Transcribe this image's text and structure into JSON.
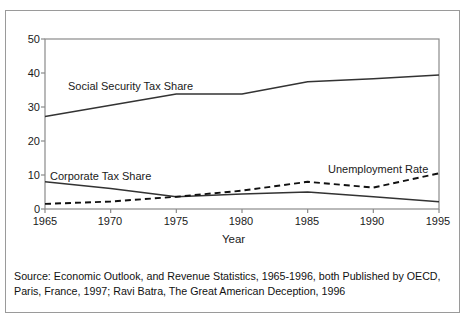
{
  "figure": {
    "top_caption": "",
    "source_note": "Source: Economic Outlook, and Revenue Statistics, 1965-1996, both Published by OECD, Paris, France, 1997; Ravi Batra, The Great American Deception, 1996"
  },
  "labels": {
    "social_security": "Social Security Tax Share",
    "corporate": "Corporate Tax Share",
    "unemployment": "Unemployment Rate"
  },
  "chart_data": {
    "type": "line",
    "title": "",
    "xlabel": "Year",
    "ylabel": "",
    "x": [
      1965,
      1970,
      1975,
      1980,
      1985,
      1990,
      1995
    ],
    "xlim": [
      1965,
      1995
    ],
    "ylim": [
      0,
      50
    ],
    "yticks": [
      0,
      10,
      20,
      30,
      40,
      50
    ],
    "xticks": [
      1965,
      1970,
      1975,
      1980,
      1985,
      1990,
      1995
    ],
    "xtick_labels": [
      "1965",
      "1970",
      "1975",
      "1980",
      "1985",
      "1990",
      "1995"
    ],
    "ytick_labels": [
      "0",
      "10",
      "20",
      "30",
      "40",
      "50"
    ],
    "grid": false,
    "legend": "inline-annotations",
    "series": [
      {
        "name": "Social Security Tax Share",
        "style": "solid",
        "color": "#333333",
        "values": [
          27.2,
          30.5,
          33.8,
          33.8,
          37.4,
          38.3,
          39.4
        ]
      },
      {
        "name": "Corporate Tax Share",
        "style": "solid",
        "color": "#333333",
        "values": [
          8.0,
          6.0,
          3.6,
          4.4,
          5.0,
          3.6,
          2.1
        ]
      },
      {
        "name": "Unemployment Rate",
        "style": "dashed",
        "color": "#111111",
        "values": [
          1.5,
          2.2,
          3.6,
          5.4,
          8.0,
          6.3,
          10.5
        ]
      }
    ]
  }
}
